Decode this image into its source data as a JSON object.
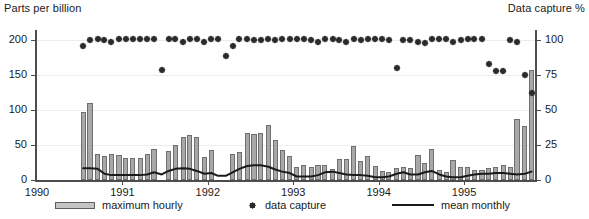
{
  "chart_data": {
    "type": "bar",
    "title": "",
    "ylabel": "Parts per billion",
    "ylabel_right": "Data capture %",
    "xlabel": "",
    "ylim": [
      0,
      215
    ],
    "ylim_right": [
      0,
      107.5
    ],
    "xlim": [
      "1990.0",
      "1995.83"
    ],
    "grid": true,
    "legend_position": "bottom",
    "yticks": [
      0,
      50,
      100,
      150,
      200
    ],
    "yticks_right": [
      0,
      25,
      50,
      75,
      100
    ],
    "xticks": [
      "1990",
      "1991",
      "1992",
      "1993",
      "1994",
      "1995"
    ],
    "legend": [
      {
        "label": "maximum hourly",
        "marker": "bar"
      },
      {
        "label": "data capture",
        "marker": "diamond"
      },
      {
        "label": "mean monthly",
        "marker": "line"
      }
    ],
    "series": [
      {
        "name": "maximum hourly",
        "type": "bar",
        "axis": "left",
        "units": "ppb",
        "x": [
          1990.54,
          1990.62,
          1990.71,
          1990.79,
          1990.87,
          1990.96,
          1991.04,
          1991.12,
          1991.21,
          1991.29,
          1991.37,
          1991.46,
          1991.54,
          1991.62,
          1991.71,
          1991.79,
          1991.87,
          1991.96,
          1992.04,
          1992.12,
          1992.21,
          1992.29,
          1992.37,
          1992.46,
          1992.54,
          1992.62,
          1992.71,
          1992.79,
          1992.87,
          1992.96,
          1993.04,
          1993.12,
          1993.21,
          1993.29,
          1993.37,
          1993.46,
          1993.54,
          1993.62,
          1993.71,
          1993.79,
          1993.87,
          1993.96,
          1994.04,
          1994.12,
          1994.21,
          1994.29,
          1994.37,
          1994.46,
          1994.54,
          1994.62,
          1994.71,
          1994.79,
          1994.87,
          1994.96,
          1995.04,
          1995.12,
          1995.21,
          1995.29,
          1995.37,
          1995.46,
          1995.54,
          1995.62,
          1995.71,
          1995.79
        ],
        "values": [
          98,
          110,
          37,
          35,
          37,
          36,
          31,
          32,
          32,
          38,
          45,
          0,
          42,
          50,
          62,
          65,
          62,
          33,
          43,
          0,
          0,
          38,
          40,
          68,
          66,
          68,
          79,
          58,
          43,
          34,
          19,
          22,
          18,
          21,
          22,
          16,
          30,
          30,
          49,
          27,
          34,
          20,
          13,
          11,
          17,
          18,
          17,
          36,
          25,
          44,
          15,
          12,
          28,
          18,
          18,
          15,
          14,
          17,
          18,
          21,
          18,
          88,
          77,
          158
        ]
      },
      {
        "name": "data capture",
        "type": "scatter",
        "axis": "right",
        "units": "%",
        "x": [
          1990.54,
          1990.62,
          1990.71,
          1990.79,
          1990.87,
          1990.96,
          1991.04,
          1991.12,
          1991.21,
          1991.29,
          1991.37,
          1991.46,
          1991.54,
          1991.62,
          1991.71,
          1991.79,
          1991.87,
          1991.96,
          1992.04,
          1992.12,
          1992.21,
          1992.29,
          1992.37,
          1992.46,
          1992.54,
          1992.62,
          1992.71,
          1992.79,
          1992.87,
          1992.96,
          1993.04,
          1993.12,
          1993.21,
          1993.29,
          1993.37,
          1993.46,
          1993.54,
          1993.62,
          1993.71,
          1993.79,
          1993.87,
          1993.96,
          1994.04,
          1994.12,
          1994.21,
          1994.29,
          1994.37,
          1994.46,
          1994.54,
          1994.62,
          1994.71,
          1994.79,
          1994.87,
          1994.96,
          1995.04,
          1995.12,
          1995.21,
          1995.29,
          1995.37,
          1995.46,
          1995.54,
          1995.62,
          1995.71,
          1995.79
        ],
        "values": [
          96,
          100,
          101,
          100,
          99,
          101,
          101,
          101,
          101,
          101,
          101,
          79,
          101,
          101,
          99,
          101,
          101,
          99,
          101,
          101,
          89,
          96,
          101,
          101,
          100,
          100,
          101,
          100,
          101,
          101,
          101,
          101,
          100,
          99,
          101,
          101,
          100,
          99,
          101,
          100,
          101,
          101,
          101,
          100,
          80,
          100,
          100,
          99,
          98,
          101,
          101,
          101,
          99,
          100,
          101,
          101,
          101,
          83,
          78,
          78,
          100,
          99,
          75,
          62
        ]
      },
      {
        "name": "mean monthly",
        "type": "line",
        "axis": "left",
        "units": "ppb",
        "x": [
          1990.54,
          1990.62,
          1990.71,
          1990.79,
          1990.87,
          1990.96,
          1991.04,
          1991.12,
          1991.21,
          1991.29,
          1991.37,
          1991.46,
          1991.54,
          1991.62,
          1991.71,
          1991.79,
          1991.87,
          1991.96,
          1992.04,
          1992.12,
          1992.21,
          1992.29,
          1992.37,
          1992.46,
          1992.54,
          1992.62,
          1992.71,
          1992.79,
          1992.87,
          1992.96,
          1993.04,
          1993.12,
          1993.21,
          1993.29,
          1993.37,
          1993.46,
          1993.54,
          1993.62,
          1993.71,
          1993.79,
          1993.87,
          1993.96,
          1994.04,
          1994.12,
          1994.21,
          1994.29,
          1994.37,
          1994.46,
          1994.54,
          1994.62,
          1994.71,
          1994.79,
          1994.87,
          1994.96,
          1995.04,
          1995.12,
          1995.21,
          1995.29,
          1995.37,
          1995.46,
          1995.54,
          1995.62,
          1995.71,
          1995.79
        ],
        "values": [
          17,
          17,
          16,
          9,
          7,
          7,
          7,
          7,
          7,
          8,
          11,
          8,
          13,
          16,
          17,
          16,
          13,
          9,
          10,
          6,
          6,
          11,
          16,
          20,
          21,
          21,
          19,
          15,
          12,
          10,
          5,
          5,
          5,
          7,
          11,
          12,
          10,
          8,
          7,
          7,
          6,
          4,
          4,
          5,
          9,
          11,
          8,
          8,
          11,
          13,
          8,
          5,
          4,
          4,
          6,
          8,
          9,
          9,
          10,
          10,
          9,
          8,
          9,
          12
        ]
      }
    ]
  },
  "axes": {
    "left_title": "Parts per billion",
    "right_title": "Data capture %",
    "left_ticks": [
      "200",
      "150",
      "100",
      "50",
      "0"
    ],
    "right_ticks": [
      "100",
      "75",
      "50",
      "25",
      "0"
    ],
    "x_ticks": [
      "1990",
      "1991",
      "1992",
      "1993",
      "1994",
      "1995"
    ]
  },
  "legend": {
    "bar_label": "maximum hourly",
    "dot_label": "data capture",
    "line_label": "mean monthly"
  },
  "colors": {
    "bar_fill": "#a8a8a8",
    "bar_edge": "#6e6e6e",
    "dot": "#2b2b2b",
    "line": "#1a1a1a",
    "axis": "#4d4d4d",
    "grid": "#ececec",
    "text": "#1a1a1a"
  }
}
